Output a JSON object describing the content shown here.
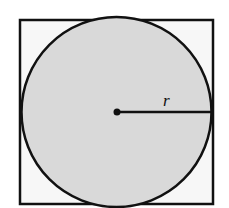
{
  "diagram": {
    "square": {
      "x": 20,
      "y": 20,
      "size": 193,
      "fill": "#f7f7f7",
      "stroke": "#111111"
    },
    "circle": {
      "cx": 116.5,
      "cy": 112,
      "r": 96,
      "fill": "#d9d9d9",
      "stroke": "#111111"
    },
    "center_point": {
      "cx": 117,
      "cy": 112
    },
    "radius_line": {
      "x1": 117,
      "y1": 112,
      "x2": 212,
      "y2": 112
    },
    "labels": {
      "radius": "r"
    }
  }
}
